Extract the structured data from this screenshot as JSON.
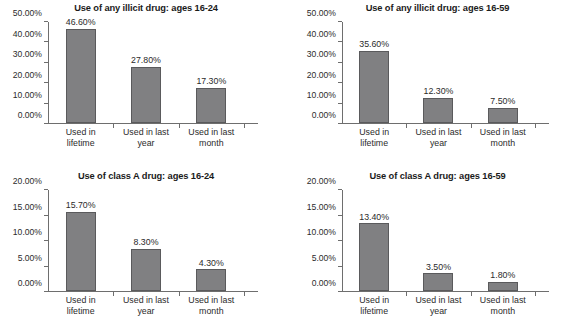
{
  "figure": {
    "background_color": "#ffffff",
    "bar_color": "#808082",
    "bar_border_color": "#5a5a5c",
    "axis_color": "#6e6e6e",
    "text_color": "#2b2b2b"
  },
  "categories": [
    {
      "line1": "Used in",
      "line2": "lifetime"
    },
    {
      "line1": "Used in last",
      "line2": "year"
    },
    {
      "line1": "Used in last",
      "line2": "month"
    }
  ],
  "charts": [
    {
      "title": "Use of any illicit drug: ages 16-24",
      "ylim_max": 50,
      "yticks": [
        "0.00%",
        "10.00%",
        "20.00%",
        "30.00%",
        "40.00%",
        "50.00%"
      ],
      "ytick_values": [
        0,
        10,
        20,
        30,
        40,
        50
      ],
      "values": [
        46.6,
        27.8,
        17.3
      ],
      "labels": [
        "46.60%",
        "27.80%",
        "17.30%"
      ]
    },
    {
      "title": "Use of any illicit drug: ages 16-59",
      "ylim_max": 50,
      "yticks": [
        "0.00%",
        "10.00%",
        "20.00%",
        "30.00%",
        "40.00%",
        "50.00%"
      ],
      "ytick_values": [
        0,
        10,
        20,
        30,
        40,
        50
      ],
      "values": [
        35.6,
        12.3,
        7.5
      ],
      "labels": [
        "35.60%",
        "12.30%",
        "7.50%"
      ]
    },
    {
      "title": "Use of class A drug: ages 16-24",
      "ylim_max": 20,
      "yticks": [
        "0.00%",
        "5.00%",
        "10.00%",
        "15.00%",
        "20.00%"
      ],
      "ytick_values": [
        0,
        5,
        10,
        15,
        20
      ],
      "values": [
        15.7,
        8.3,
        4.3
      ],
      "labels": [
        "15.70%",
        "8.30%",
        "4.30%"
      ]
    },
    {
      "title": "Use of class A drug: ages 16-59",
      "ylim_max": 20,
      "yticks": [
        "0.00%",
        "5.00%",
        "10.00%",
        "15.00%",
        "20.00%"
      ],
      "ytick_values": [
        0,
        5,
        10,
        15,
        20
      ],
      "values": [
        13.4,
        3.5,
        1.8
      ],
      "labels": [
        "13.40%",
        "3.50%",
        "1.80%"
      ]
    }
  ],
  "chart_data": [
    {
      "type": "bar",
      "title": "Use of any illicit drug: ages 16-24",
      "categories": [
        "Used in lifetime",
        "Used in last year",
        "Used in last month"
      ],
      "values": [
        46.6,
        27.8,
        17.3
      ],
      "data_labels": [
        "46.60%",
        "27.80%",
        "17.30%"
      ],
      "xlabel": "",
      "ylabel": "",
      "ylim": [
        0,
        50
      ],
      "ytick_labels": [
        "0.00%",
        "10.00%",
        "20.00%",
        "30.00%",
        "40.00%",
        "50.00%"
      ],
      "grid": false,
      "legend": false,
      "units": "percent"
    },
    {
      "type": "bar",
      "title": "Use of any illicit drug: ages 16-59",
      "categories": [
        "Used in lifetime",
        "Used in last year",
        "Used in last month"
      ],
      "values": [
        35.6,
        12.3,
        7.5
      ],
      "data_labels": [
        "35.60%",
        "12.30%",
        "7.50%"
      ],
      "xlabel": "",
      "ylabel": "",
      "ylim": [
        0,
        50
      ],
      "ytick_labels": [
        "0.00%",
        "10.00%",
        "20.00%",
        "30.00%",
        "40.00%",
        "50.00%"
      ],
      "grid": false,
      "legend": false,
      "units": "percent"
    },
    {
      "type": "bar",
      "title": "Use of class A drug: ages 16-24",
      "categories": [
        "Used in lifetime",
        "Used in last year",
        "Used in last month"
      ],
      "values": [
        15.7,
        8.3,
        4.3
      ],
      "data_labels": [
        "15.70%",
        "8.30%",
        "4.30%"
      ],
      "xlabel": "",
      "ylabel": "",
      "ylim": [
        0,
        20
      ],
      "ytick_labels": [
        "0.00%",
        "5.00%",
        "10.00%",
        "15.00%",
        "20.00%"
      ],
      "grid": false,
      "legend": false,
      "units": "percent"
    },
    {
      "type": "bar",
      "title": "Use of class A drug: ages 16-59",
      "categories": [
        "Used in lifetime",
        "Used in last year",
        "Used in last month"
      ],
      "values": [
        13.4,
        3.5,
        1.8
      ],
      "data_labels": [
        "13.40%",
        "3.50%",
        "1.80%"
      ],
      "xlabel": "",
      "ylabel": "",
      "ylim": [
        0,
        20
      ],
      "ytick_labels": [
        "0.00%",
        "5.00%",
        "10.00%",
        "15.00%",
        "20.00%"
      ],
      "grid": false,
      "legend": false,
      "units": "percent"
    }
  ]
}
